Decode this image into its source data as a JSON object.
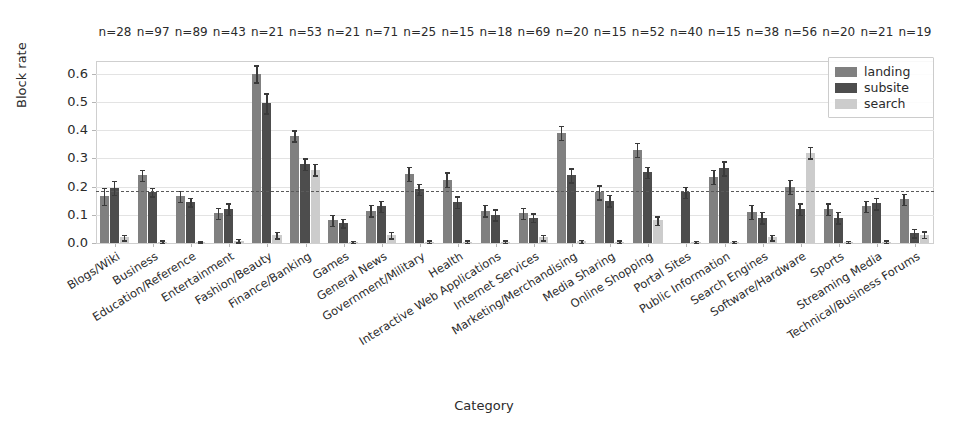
{
  "chart_data": {
    "type": "bar",
    "title": "",
    "xlabel": "Category",
    "ylabel": "Block rate",
    "ylim": [
      0.0,
      0.645
    ],
    "yticks": [
      0.0,
      0.1,
      0.2,
      0.3,
      0.4,
      0.5,
      0.6
    ],
    "ytick_labels": [
      "0.0",
      "0.1",
      "0.2",
      "0.3",
      "0.4",
      "0.5",
      "0.6"
    ],
    "grid": true,
    "legend_position": "upper right",
    "reference_line": {
      "value": 0.185,
      "style": "dashed",
      "color": "#5a5a5a"
    },
    "categories": [
      "Blogs/Wiki",
      "Business",
      "Education/Reference",
      "Entertainment",
      "Fashion/Beauty",
      "Finance/Banking",
      "Games",
      "General News",
      "Government/Military",
      "Health",
      "Interactive Web Applications",
      "Internet Services",
      "Marketing/Merchandising",
      "Media Sharing",
      "Online Shopping",
      "Portal Sites",
      "Public Information",
      "Search Engines",
      "Software/Hardware",
      "Sports",
      "Streaming Media",
      "Technical/Business Forums"
    ],
    "sample_sizes": [
      28,
      97,
      89,
      43,
      21,
      53,
      21,
      71,
      25,
      15,
      18,
      69,
      20,
      15,
      52,
      40,
      15,
      38,
      56,
      20,
      21,
      19
    ],
    "sample_size_labels": [
      "n=28",
      "n=97",
      "n=89",
      "n=43",
      "n=21",
      "n=53",
      "n=21",
      "n=71",
      "n=25",
      "n=15",
      "n=18",
      "n=69",
      "n=20",
      "n=15",
      "n=52",
      "n=40",
      "n=15",
      "n=38",
      "n=56",
      "n=20",
      "n=21",
      "n=19"
    ],
    "series": [
      {
        "name": "landing",
        "color": "#808080",
        "values": [
          0.165,
          0.24,
          0.165,
          0.105,
          0.6,
          0.38,
          0.08,
          0.115,
          0.245,
          0.225,
          0.115,
          0.105,
          0.39,
          0.18,
          0.33,
          0.0,
          0.235,
          0.11,
          0.2,
          0.12,
          0.13,
          0.155
        ],
        "errors": [
          0.03,
          0.02,
          0.02,
          0.02,
          0.03,
          0.02,
          0.02,
          0.02,
          0.025,
          0.025,
          0.02,
          0.02,
          0.025,
          0.025,
          0.025,
          0.0,
          0.025,
          0.025,
          0.025,
          0.02,
          0.02,
          0.02
        ]
      },
      {
        "name": "subsite",
        "color": "#4d4d4d",
        "values": [
          0.195,
          0.18,
          0.145,
          0.12,
          0.495,
          0.28,
          0.07,
          0.13,
          0.19,
          0.145,
          0.1,
          0.09,
          0.24,
          0.15,
          0.25,
          0.18,
          0.265,
          0.09,
          0.12,
          0.09,
          0.14,
          0.035
        ],
        "errors": [
          0.025,
          0.015,
          0.015,
          0.02,
          0.035,
          0.02,
          0.015,
          0.02,
          0.02,
          0.02,
          0.02,
          0.015,
          0.025,
          0.02,
          0.02,
          0.02,
          0.025,
          0.02,
          0.02,
          0.02,
          0.02,
          0.015
        ]
      },
      {
        "name": "search",
        "color": "#cccccc",
        "values": [
          0.02,
          0.005,
          0.003,
          0.008,
          0.028,
          0.26,
          0.004,
          0.028,
          0.005,
          0.005,
          0.005,
          0.02,
          0.006,
          0.005,
          0.08,
          0.004,
          0.004,
          0.02,
          0.32,
          0.004,
          0.005,
          0.03
        ],
        "errors": [
          0.01,
          0.004,
          0.003,
          0.006,
          0.012,
          0.02,
          0.004,
          0.012,
          0.004,
          0.004,
          0.004,
          0.01,
          0.005,
          0.004,
          0.015,
          0.004,
          0.004,
          0.01,
          0.02,
          0.004,
          0.004,
          0.012
        ]
      }
    ]
  },
  "axes": {
    "ylabel": "Block rate",
    "xlabel": "Category"
  },
  "legend": {
    "items": [
      {
        "label": "landing",
        "color": "#808080"
      },
      {
        "label": "subsite",
        "color": "#4d4d4d"
      },
      {
        "label": "search",
        "color": "#cccccc"
      }
    ]
  }
}
